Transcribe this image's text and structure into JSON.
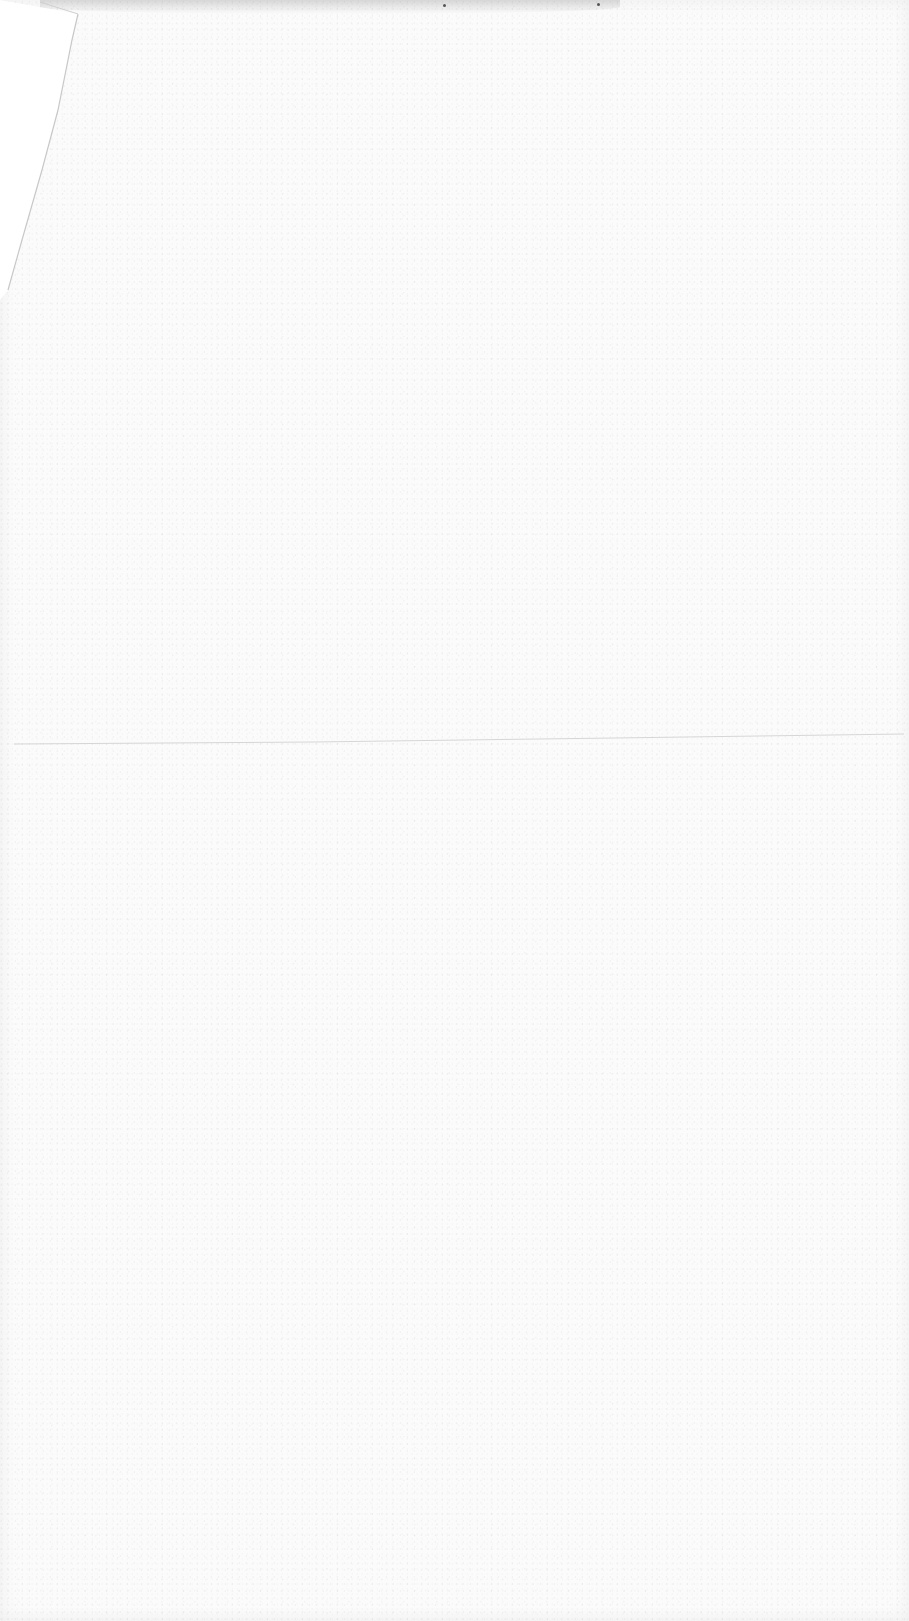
{
  "document": {
    "type": "blank-scanned-page",
    "text_content": "",
    "features": {
      "fold_crease": true,
      "folded_corner": "top-left"
    },
    "colors": {
      "paper": "#fbfbfb",
      "crease": "#d6d6d6",
      "edge_shadow": "#e2e2e2"
    }
  }
}
